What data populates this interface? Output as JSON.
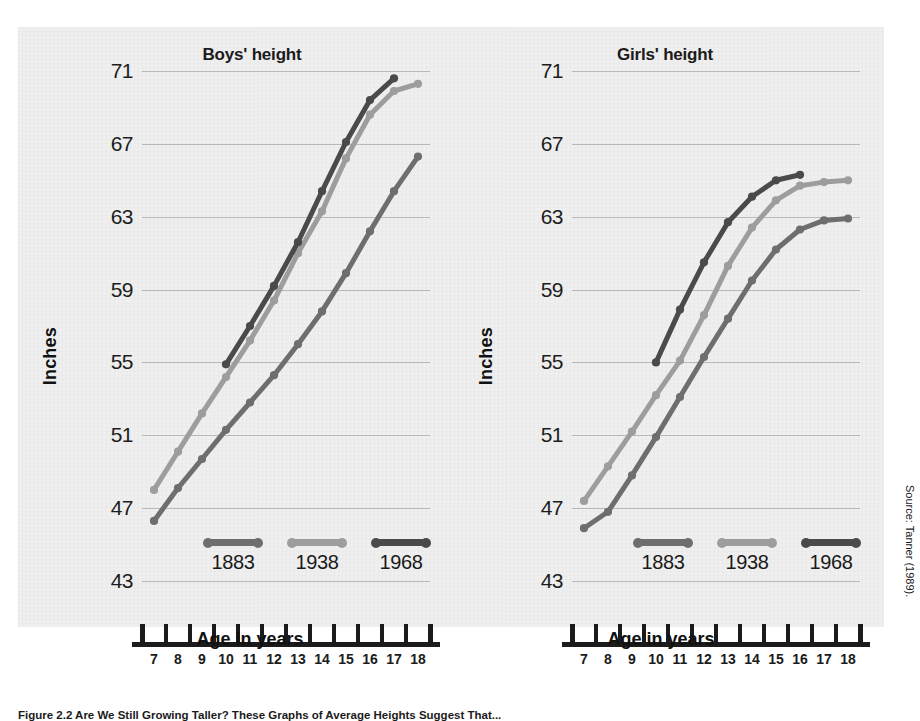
{
  "figure": {
    "source_note": "Source: Tanner (1989).",
    "caption": "Figure 2.2  Are We Still Growing Taller? These Graphs of Average Heights Suggest That...",
    "ylabel": "Inches",
    "xlabel": "Age in years"
  },
  "legend": {
    "items": [
      {
        "label": "1883",
        "color": "#6e6e6e"
      },
      {
        "label": "1938",
        "color": "#9d9d9d"
      },
      {
        "label": "1968",
        "color": "#4a4a4a"
      }
    ]
  },
  "chart_data": [
    {
      "type": "line",
      "title": "Boys' height",
      "xlabel": "Age in years",
      "ylabel": "Inches",
      "xlim": [
        6.5,
        18.5
      ],
      "ylim": [
        43,
        71
      ],
      "yticks": [
        43,
        47,
        51,
        55,
        59,
        63,
        67,
        71
      ],
      "xticks": [
        7,
        8,
        9,
        10,
        11,
        12,
        13,
        14,
        15,
        16,
        17,
        18
      ],
      "grid": true,
      "legend_position": "inside-bottom",
      "series": [
        {
          "name": "1883",
          "color": "#6e6e6e",
          "x": [
            7,
            8,
            9,
            10,
            11,
            12,
            13,
            14,
            15,
            16,
            17,
            18
          ],
          "values": [
            46.3,
            48.1,
            49.7,
            51.3,
            52.8,
            54.3,
            56.0,
            57.8,
            59.9,
            62.2,
            64.4,
            66.3
          ]
        },
        {
          "name": "1938",
          "color": "#9d9d9d",
          "x": [
            7,
            8,
            9,
            10,
            11,
            12,
            13,
            14,
            15,
            16,
            17,
            18
          ],
          "values": [
            48.0,
            50.1,
            52.2,
            54.2,
            56.2,
            58.4,
            61.0,
            63.3,
            66.2,
            68.6,
            69.9,
            70.3
          ]
        },
        {
          "name": "1968",
          "color": "#4a4a4a",
          "x": [
            10,
            11,
            12,
            13,
            14,
            15,
            16,
            17
          ],
          "values": [
            54.9,
            57.0,
            59.2,
            61.6,
            64.4,
            67.1,
            69.4,
            70.6
          ]
        }
      ]
    },
    {
      "type": "line",
      "title": "Girls' height",
      "xlabel": "Age in years",
      "ylabel": "Inches",
      "xlim": [
        6.5,
        18.5
      ],
      "ylim": [
        43,
        71
      ],
      "yticks": [
        43,
        47,
        51,
        55,
        59,
        63,
        67,
        71
      ],
      "xticks": [
        7,
        8,
        9,
        10,
        11,
        12,
        13,
        14,
        15,
        16,
        17,
        18
      ],
      "grid": true,
      "legend_position": "inside-bottom",
      "series": [
        {
          "name": "1883",
          "color": "#6e6e6e",
          "x": [
            7,
            8,
            9,
            10,
            11,
            12,
            13,
            14,
            15,
            16,
            17,
            18
          ],
          "values": [
            45.9,
            46.8,
            48.8,
            50.9,
            53.1,
            55.3,
            57.4,
            59.5,
            61.2,
            62.3,
            62.8,
            62.9
          ]
        },
        {
          "name": "1938",
          "color": "#9d9d9d",
          "x": [
            7,
            8,
            9,
            10,
            11,
            12,
            13,
            14,
            15,
            16,
            17,
            18
          ],
          "values": [
            47.4,
            49.3,
            51.2,
            53.2,
            55.1,
            57.6,
            60.3,
            62.4,
            63.9,
            64.7,
            64.9,
            65.0
          ]
        },
        {
          "name": "1968",
          "color": "#4a4a4a",
          "x": [
            10,
            11,
            12,
            13,
            14,
            15,
            16
          ],
          "values": [
            55.0,
            57.9,
            60.5,
            62.7,
            64.1,
            65.0,
            65.3
          ]
        }
      ]
    }
  ]
}
